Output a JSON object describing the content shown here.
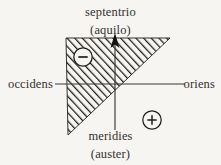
{
  "diagram": {
    "title_implied": "Compass-rose sign diagram",
    "background_color": "#f7f5f1",
    "line_color": "#3a3836",
    "hatch_color": "#201e1c",
    "labels": {
      "north_main": "septentrio",
      "north_alt": "(aquilo)",
      "south_main": "meridies",
      "south_alt": "(auster)",
      "west": "occidens",
      "east": "oriens"
    },
    "signs": {
      "negative": "−",
      "positive": "+"
    },
    "axes": {
      "horizontal_y": 84,
      "horizontal_x_start": 55,
      "horizontal_x_end": 185,
      "vertical_x": 115,
      "vertical_y_start": 38,
      "vertical_y_end": 130,
      "arrow_direction": "up"
    },
    "hatched_region": {
      "shape": "triangle",
      "vertices": [
        [
          66,
          38
        ],
        [
          170,
          38
        ],
        [
          68,
          135
        ]
      ],
      "hatch_angle_deg": 45,
      "hatch_spacing_px": 4
    },
    "sign_markers": [
      {
        "name": "minus",
        "glyph": "−",
        "cx": 83,
        "cy": 57,
        "r": 9,
        "on_hatch": true
      },
      {
        "name": "plus",
        "glyph": "+",
        "cx": 152,
        "cy": 120,
        "r": 9,
        "on_hatch": false
      }
    ]
  }
}
